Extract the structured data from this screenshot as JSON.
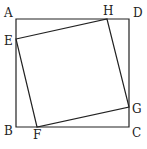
{
  "diagram": {
    "type": "geometry",
    "outer_square": {
      "vertices": {
        "A": {
          "label": "A",
          "x": 16,
          "y": 19
        },
        "D": {
          "label": "D",
          "x": 129,
          "y": 19
        },
        "C": {
          "label": "C",
          "x": 129,
          "y": 127
        },
        "B": {
          "label": "B",
          "x": 16,
          "y": 127
        }
      }
    },
    "inner_square": {
      "vertices": {
        "E": {
          "label": "E",
          "x": 16,
          "y": 39
        },
        "H": {
          "label": "H",
          "x": 107,
          "y": 19
        },
        "G": {
          "label": "G",
          "x": 129,
          "y": 107
        },
        "F": {
          "label": "F",
          "x": 37,
          "y": 127
        }
      }
    },
    "labels": {
      "A": "A",
      "B": "B",
      "C": "C",
      "D": "D",
      "E": "E",
      "F": "F",
      "G": "G",
      "H": "H"
    },
    "colors": {
      "line": "#222222",
      "background": "#ffffff"
    }
  }
}
